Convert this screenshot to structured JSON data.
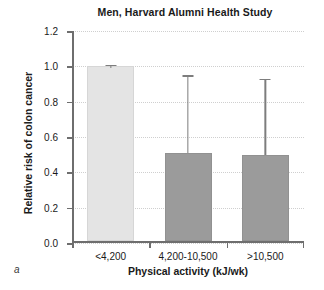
{
  "chart_data": {
    "type": "bar",
    "title": "Men, Harvard Alumni Health Study",
    "xlabel": "Physical activity (kJ/wk)",
    "ylabel": "Relative risk of colon cancer",
    "panel_label": "a",
    "categories": [
      "<4,200",
      "4,200-10,500",
      ">10,500"
    ],
    "values": [
      1.0,
      0.51,
      0.5
    ],
    "error_high": [
      1.01,
      0.95,
      0.93
    ],
    "error_low": [
      0.99,
      0.51,
      0.5
    ],
    "bar_colors": [
      "#e4e4e4",
      "#9b9b9b",
      "#9b9b9b"
    ],
    "ylim": [
      0.0,
      1.2
    ],
    "yticks": [
      "0.0",
      "0.2",
      "0.4",
      "0.6",
      "0.8",
      "1.0",
      "1.2"
    ],
    "ytick_values": [
      0.0,
      0.2,
      0.4,
      0.6,
      0.8,
      1.0,
      1.2
    ],
    "grid": true,
    "grid_color": "#cfcfcf",
    "axis_color": "#6e6e6e",
    "errorbar_color": "#7d7d7d",
    "legend": null
  }
}
